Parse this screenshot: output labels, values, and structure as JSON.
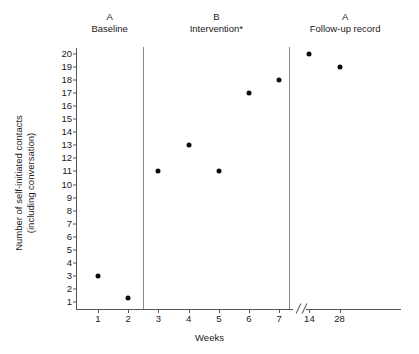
{
  "chart_data": {
    "type": "scatter",
    "title": "",
    "xlabel": "Weeks",
    "ylabel": "Number of self-initiated contacts (including conversation)",
    "ylabel_line1": "Number of self-initiated contacts",
    "ylabel_line2": "(including conversation)",
    "ylim": [
      1,
      20
    ],
    "yticks": [
      20,
      19,
      18,
      17,
      16,
      15,
      14,
      13,
      12,
      11,
      10,
      9,
      8,
      7,
      6,
      5,
      4,
      3,
      2,
      1
    ],
    "xticks": [
      "1",
      "2",
      "3",
      "4",
      "5",
      "6",
      "7",
      "14",
      "28"
    ],
    "axis_break": {
      "present": true,
      "symbol": "//",
      "after_tick": "7",
      "before_tick": "14"
    },
    "grid": false,
    "legend": false,
    "marker": "filled-circle",
    "marker_color": "#0d0d0d",
    "phases": [
      {
        "letter": "A",
        "name": "Baseline"
      },
      {
        "letter": "B",
        "name": "Intervention*"
      },
      {
        "letter": "A",
        "name": "Follow-up record"
      }
    ],
    "points": [
      {
        "x": "1",
        "y": 3,
        "phase": "Baseline"
      },
      {
        "x": "2",
        "y": 1.3,
        "phase": "Baseline"
      },
      {
        "x": "3",
        "y": 11,
        "phase": "Intervention*"
      },
      {
        "x": "4",
        "y": 13,
        "phase": "Intervention*"
      },
      {
        "x": "5",
        "y": 11,
        "phase": "Intervention*"
      },
      {
        "x": "6",
        "y": 17,
        "phase": "Intervention*"
      },
      {
        "x": "7",
        "y": 18,
        "phase": "Intervention*"
      },
      {
        "x": "14",
        "y": 20,
        "phase": "Follow-up record"
      },
      {
        "x": "28",
        "y": 19,
        "phase": "Follow-up record"
      }
    ],
    "series": [
      {
        "name": "Self-initiated contacts",
        "x": [
          "1",
          "2",
          "3",
          "4",
          "5",
          "6",
          "7",
          "14",
          "28"
        ],
        "values": [
          3,
          1.3,
          11,
          13,
          11,
          17,
          18,
          20,
          19
        ]
      }
    ],
    "colors": {
      "marker": "#0d0d0d",
      "axis": "#555555",
      "divider": "#8a8a8a",
      "text": "#1a1a1a",
      "background": "#ffffff"
    }
  }
}
